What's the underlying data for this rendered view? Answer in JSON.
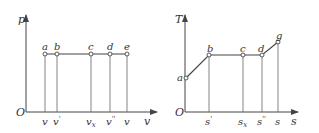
{
  "pv_diagram": {
    "y_axis_label": "p",
    "x_axis_label": "v",
    "origin_label": "O",
    "points": [
      {
        "label": "a",
        "x_label": "v",
        "x_sub": ""
      },
      {
        "label": "b",
        "x_label": "v",
        "x_sub": "'"
      },
      {
        "label": "c",
        "x_label": "v",
        "x_sub": "x"
      },
      {
        "label": "d",
        "x_label": "v",
        "x_sub": "''"
      },
      {
        "label": "e",
        "x_label": "v",
        "x_sub": ""
      }
    ]
  },
  "ts_diagram": {
    "y_axis_label": "T",
    "x_axis_label": "s",
    "origin_label": "O",
    "points": [
      {
        "label": "a",
        "x_label": ""
      },
      {
        "label": "b",
        "x_label": "s",
        "x_sub": "'"
      },
      {
        "label": "c",
        "x_label": "s",
        "x_sub": "x"
      },
      {
        "label": "d",
        "x_label": "s",
        "x_sub": "''"
      },
      {
        "label": "g",
        "x_label": "s",
        "x_sub": ""
      }
    ]
  },
  "colors": {
    "line": "#444444",
    "text": "#333333",
    "background": "#ffffff"
  }
}
